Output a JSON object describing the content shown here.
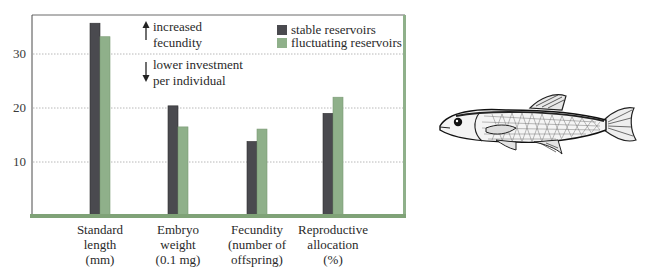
{
  "chart_data": {
    "type": "bar",
    "title": "",
    "xlabel": "",
    "ylabel": "",
    "ylim": [
      0,
      38
    ],
    "yticks": [
      10,
      20,
      30
    ],
    "grid": true,
    "legend_position": "top-right",
    "categories": [
      [
        "Standard",
        "length",
        "(mm)"
      ],
      [
        "Embryo",
        "weight",
        "(0.1 mg)"
      ],
      [
        "Fecundity",
        "(number of",
        "offspring)"
      ],
      [
        "Reproductive",
        "allocation",
        "(%)"
      ]
    ],
    "series": [
      {
        "name": "stable reservoirs",
        "color": "#4a4a4f",
        "values": [
          35.7,
          20.4,
          13.8,
          19.0
        ]
      },
      {
        "name": "fluctuating reservoirs",
        "color": "#8fb08a",
        "values": [
          33.2,
          16.5,
          16.1,
          22.0
        ]
      }
    ],
    "annotations": [
      {
        "arrow": "up",
        "lines": [
          "increased",
          "fecundity"
        ]
      },
      {
        "arrow": "down",
        "lines": [
          "lower investment",
          "per individual"
        ]
      }
    ]
  },
  "illustration": {
    "subject": "fish-icon"
  },
  "colors": {
    "axis_green": "#7fa277",
    "grid": "#b8b8b8",
    "frame": "#555555"
  }
}
